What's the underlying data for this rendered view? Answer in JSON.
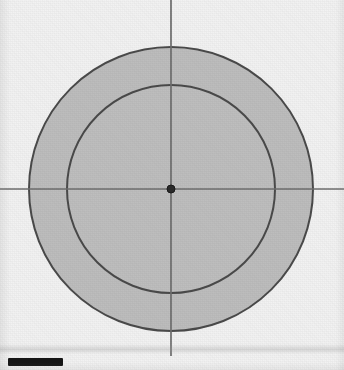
{
  "figure": {
    "background_color": "#f2f2f2",
    "fill_color": "#b9b9b9",
    "stroke_color": "#4a4a4a",
    "axis_color": "#6e6e6e",
    "center_dot_color": "#2b2b2b"
  },
  "chart_data": {
    "type": "scatter",
    "title": "",
    "xlabel": "",
    "ylabel": "",
    "grid": false,
    "legend": null,
    "center": {
      "x": 171,
      "y": 189
    },
    "shapes": [
      {
        "name": "outer-circle",
        "kind": "circle",
        "cx": 171,
        "cy": 189,
        "r": 142,
        "fill": "#b9b9b9",
        "stroke": "#4a4a4a",
        "stroke_width": 2
      },
      {
        "name": "inner-circle",
        "kind": "circle",
        "cx": 171,
        "cy": 189,
        "r": 104,
        "fill": "#bdbdbd",
        "stroke": "#4a4a4a",
        "stroke_width": 2
      },
      {
        "name": "center-dot",
        "kind": "circle",
        "cx": 171,
        "cy": 189,
        "r": 4,
        "fill": "#2b2b2b",
        "stroke": "#1a1a1a",
        "stroke_width": 1
      }
    ],
    "axes_lines": [
      {
        "name": "horizontal-axis",
        "x1": 0,
        "y1": 189,
        "x2": 344,
        "y2": 189
      },
      {
        "name": "vertical-axis",
        "x1": 171,
        "y1": 0,
        "x2": 171,
        "y2": 356
      }
    ]
  },
  "caption": {
    "marker_label": "",
    "text": ""
  }
}
